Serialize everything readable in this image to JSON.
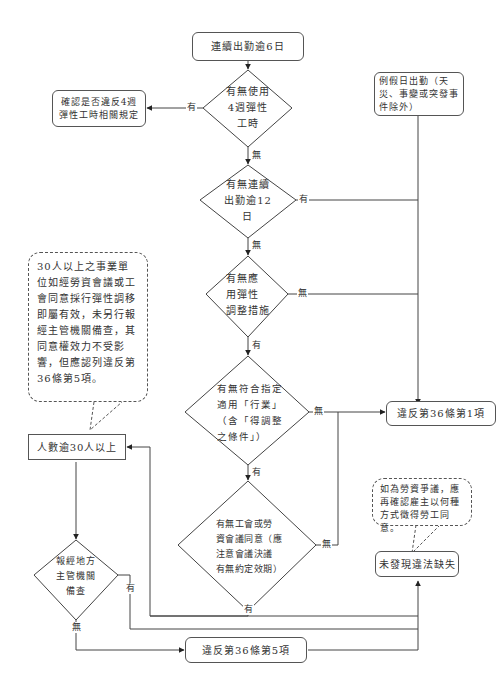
{
  "nodes": {
    "start": "連續出勤逾6日",
    "d_flex4": "有無使用\n4週彈性\n工時",
    "check4": "確認是否違反4週\n彈性工時相關規定",
    "holiday": "例假日出勤（天\n災、事變或突發事\n件除外）",
    "d_12days": "有無連續\n出勤逾12\n日",
    "d_adjust": "有無應\n用彈性\n調整措施",
    "d_industry": "有無符合指定\n適用「行業」\n（含「得調整\n之條件」）",
    "violate1": "違反第36條第1項",
    "d_union": "有無工會或勞\n資會議同意（應\n注意會議決議\n有無約定效期）",
    "over30": "人數逾30人以上",
    "d_report": "報經地方\n主管機關\n備查",
    "violate5": "違反第36條第5項",
    "no_violation": "未發現違法缺失",
    "note30": "30人以上之事業單位如經勞資會議或工會同意採行彈性調移即屬有效，未另行報經主管機關備查，其同意權效力不受影響，但應認列違反第36條第5項。",
    "note_dispute": "如為勞資爭議，應再確認雇主以何種方式徵得勞工同意。"
  },
  "labels": {
    "yes": "有",
    "no": "無"
  },
  "colors": {
    "line": "#333333",
    "border": "#555555",
    "background": "#ffffff"
  }
}
